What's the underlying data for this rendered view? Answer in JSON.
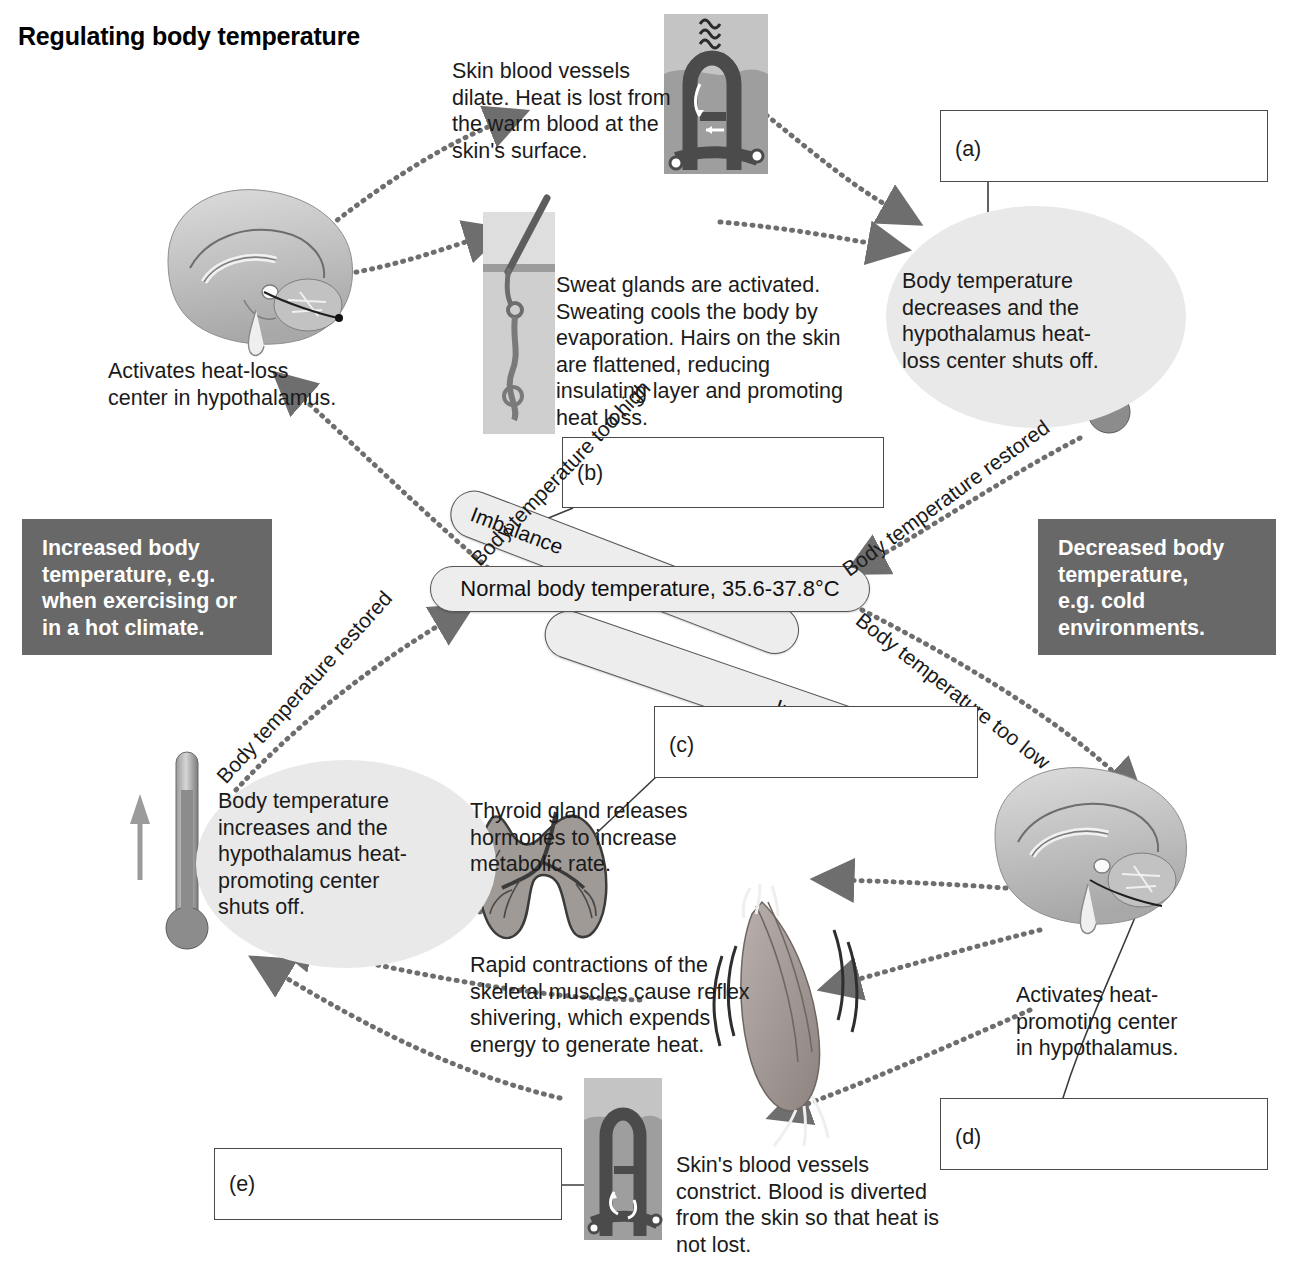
{
  "title": "Regulating body temperature",
  "colors": {
    "dark_box_bg": "#686868",
    "ellipse_shade": "#e9e9e9",
    "capsule_bg": "#ededed",
    "line": "#4a4a4a",
    "text": "#1b1b1b"
  },
  "center": {
    "normal_temp": "Normal body temperature, 35.6-37.8°C",
    "imbalance_top": "Imbalance",
    "imbalance_bottom": "Imbalance"
  },
  "answer_boxes": [
    {
      "id": "a",
      "label": "(a)",
      "value": ""
    },
    {
      "id": "b",
      "label": "(b)",
      "value": ""
    },
    {
      "id": "c",
      "label": "(c)",
      "value": ""
    },
    {
      "id": "d",
      "label": "(d)",
      "value": ""
    },
    {
      "id": "e",
      "label": "(e)",
      "value": ""
    }
  ],
  "dark_boxes": {
    "increased": "Increased body\ntemperature, e.g.\nwhen exercising or\nin a hot climate.",
    "decreased": "Decreased body\ntemperature,\ne.g. cold\nenvironments."
  },
  "top_loop": {
    "skin_vessels": "Skin blood vessels\ndilate. Heat is lost from\nthe warm blood at the\nskin's surface.",
    "sweat_glands": "Sweat glands are activated.\nSweating cools the body by\nevaporation. Hairs on the skin\nare flattened, reducing\ninsulating layer and promoting\nheat loss.",
    "activates_heat_loss": "Activates heat-loss\ncenter in hypothalamus.",
    "temp_decreases": "Body temperature\ndecreases and the\nhypothalamus heat-\nloss center shuts off."
  },
  "bottom_loop": {
    "thyroid": "Thyroid gland releases\nhormones to increase\nmetabolic rate.",
    "shivering": "Rapid contractions of the\nskeletal muscles cause reflex\nshivering, which expends\nenergy to generate heat.",
    "vasoconstriction": "Skin's blood vessels\nconstrict. Blood is diverted\nfrom the skin so that heat is\nnot lost.",
    "activates_heat_promoting": "Activates heat-\npromoting center\nin hypothalamus.",
    "temp_increases": "Body temperature\nincreases and the\nhypothalamus heat-\npromoting center\nshuts off."
  },
  "path_labels": {
    "too_high": "Body temperature too high",
    "restored_top_right": "Body temperature restored",
    "too_low": "Body temperature too low",
    "restored_bottom_left": "Body temperature restored"
  },
  "illustrations": [
    {
      "name": "skin-vasodilation-diagram",
      "alt": "Dilated skin blood vessel losing heat"
    },
    {
      "name": "hair-follicle-sweat-gland-diagram",
      "alt": "Skin cross-section with hair and sweat gland"
    },
    {
      "name": "brain-sagittal-heat-loss",
      "alt": "Sagittal brain section, hypothalamus heat-loss center"
    },
    {
      "name": "thermometer-decreasing",
      "alt": "Thermometer with downward arrow"
    },
    {
      "name": "thyroid-gland-diagram",
      "alt": "Thyroid gland"
    },
    {
      "name": "skeletal-muscle-shivering",
      "alt": "Skeletal muscle shivering"
    },
    {
      "name": "brain-sagittal-heat-promoting",
      "alt": "Sagittal brain section, hypothalamus heat-promoting center"
    },
    {
      "name": "skin-vasoconstriction-diagram",
      "alt": "Constricted skin blood vessel conserving heat"
    },
    {
      "name": "thermometer-increasing",
      "alt": "Thermometer with upward arrow"
    }
  ]
}
